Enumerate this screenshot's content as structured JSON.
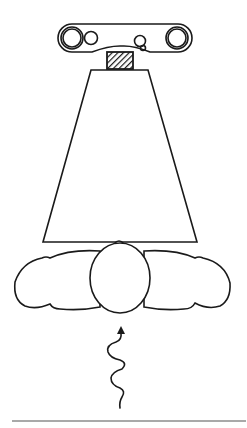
{
  "figure": {
    "type": "line-art illustration",
    "colors": {
      "stroke": "#1a1a1a",
      "background": "#ffffff",
      "rule": "#555555"
    },
    "elements": [
      "overhead-mount-bar",
      "hatched-connector",
      "cone-beam",
      "person-head",
      "person-shoulders-arms",
      "wavy-arrow",
      "baseline-rule"
    ]
  }
}
